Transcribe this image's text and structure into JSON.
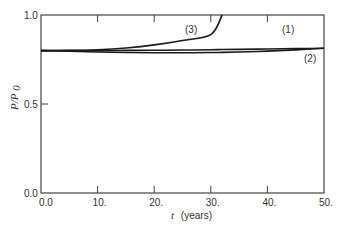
{
  "chart_data": {
    "type": "line",
    "title": "",
    "xlabel": "t (years)",
    "ylabel": "P/P0",
    "xlim": [
      0,
      50
    ],
    "ylim": [
      0,
      1.0
    ],
    "x_ticks": [
      "0.0",
      "10.",
      "20.",
      "30.",
      "40.",
      "50."
    ],
    "y_ticks": [
      "0.0",
      "0.5",
      "1.0"
    ],
    "grid": false,
    "legend": "inline labels",
    "x": [
      0,
      5,
      10,
      15,
      20,
      25,
      30,
      32,
      35,
      40,
      45,
      50
    ],
    "series": [
      {
        "name": "(1)",
        "values": [
          0.8,
          0.8,
          0.8,
          0.801,
          0.802,
          0.803,
          0.805,
          0.806,
          0.807,
          0.809,
          0.811,
          0.813
        ]
      },
      {
        "name": "(2)",
        "values": [
          0.8,
          0.796,
          0.792,
          0.789,
          0.788,
          0.788,
          0.789,
          0.79,
          0.792,
          0.797,
          0.804,
          0.813
        ]
      },
      {
        "name": "(3)",
        "values": [
          0.8,
          0.801,
          0.805,
          0.815,
          0.832,
          0.857,
          0.89,
          1.0,
          null,
          null,
          null,
          null
        ]
      }
    ]
  },
  "labels": {
    "x_axis_italic": "t",
    "x_axis_rest": "(years)",
    "y_axis_italic": "P/P",
    "y_axis_sub": "0",
    "series_1": "(1)",
    "series_2": "(2)",
    "series_3": "(3)"
  }
}
